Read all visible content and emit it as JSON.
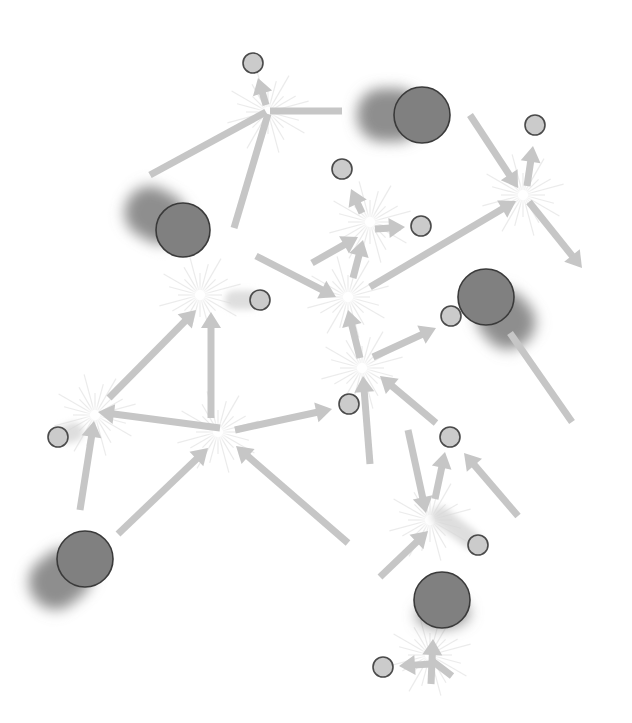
{
  "diagram": {
    "title": "",
    "type": "particle-interaction-network",
    "colors": {
      "background": "#ffffff",
      "arrow": "#c6c6c6",
      "large_particle_fill": "#808080",
      "small_particle_fill": "#cbcbcb",
      "particle_outline": "#3a3a3a",
      "burst": "#e6e6e6"
    },
    "large_particles": [
      {
        "id": "L1",
        "x": 183,
        "y": 230,
        "r": 27,
        "trail_dx": -55,
        "trail_dy": -30
      },
      {
        "id": "L2",
        "x": 422,
        "y": 115,
        "r": 28,
        "trail_dx": -65,
        "trail_dy": 0
      },
      {
        "id": "L3",
        "x": 486,
        "y": 297,
        "r": 28,
        "trail_dx": 40,
        "trail_dy": 45
      },
      {
        "id": "L4",
        "x": 85,
        "y": 559,
        "r": 28,
        "trail_dx": -50,
        "trail_dy": 40
      },
      {
        "id": "L5",
        "x": 442,
        "y": 600,
        "r": 28,
        "trail_dx": 2,
        "trail_dy": 28
      }
    ],
    "small_particles": [
      {
        "id": "S1",
        "x": 253,
        "y": 63,
        "r": 10
      },
      {
        "id": "S2",
        "x": 535,
        "y": 125,
        "r": 10
      },
      {
        "id": "S3",
        "x": 342,
        "y": 169,
        "r": 10
      },
      {
        "id": "S4",
        "x": 421,
        "y": 226,
        "r": 10
      },
      {
        "id": "S5",
        "x": 260,
        "y": 300,
        "r": 10,
        "trail_dx": -35,
        "trail_dy": 0
      },
      {
        "id": "S6",
        "x": 451,
        "y": 316,
        "r": 10
      },
      {
        "id": "S7",
        "x": 349,
        "y": 404,
        "r": 10
      },
      {
        "id": "S8",
        "x": 58,
        "y": 437,
        "r": 10,
        "trail_dx": 25,
        "trail_dy": -8
      },
      {
        "id": "S9",
        "x": 450,
        "y": 437,
        "r": 10
      },
      {
        "id": "S10",
        "x": 478,
        "y": 545,
        "r": 10,
        "trail_dx": -45,
        "trail_dy": -35
      },
      {
        "id": "S11",
        "x": 383,
        "y": 667,
        "r": 10
      }
    ],
    "vertices": [
      {
        "id": "V1",
        "x": 268,
        "y": 112
      },
      {
        "id": "V2",
        "x": 523,
        "y": 195
      },
      {
        "id": "V3",
        "x": 370,
        "y": 222
      },
      {
        "id": "V4",
        "x": 200,
        "y": 295
      },
      {
        "id": "V5",
        "x": 348,
        "y": 297
      },
      {
        "id": "V6",
        "x": 362,
        "y": 368
      },
      {
        "id": "V7",
        "x": 95,
        "y": 415
      },
      {
        "id": "V8",
        "x": 218,
        "y": 432
      },
      {
        "id": "V9",
        "x": 430,
        "y": 520
      },
      {
        "id": "V10",
        "x": 430,
        "y": 655
      }
    ],
    "arrows": [
      {
        "x1": 150,
        "y1": 175,
        "x2": 266,
        "y2": 112,
        "head": false
      },
      {
        "x1": 234,
        "y1": 228,
        "x2": 268,
        "y2": 114,
        "head": false
      },
      {
        "x1": 270,
        "y1": 111,
        "x2": 342,
        "y2": 111,
        "head": false
      },
      {
        "x1": 266,
        "y1": 105,
        "x2": 258,
        "y2": 78,
        "head": true
      },
      {
        "x1": 470,
        "y1": 115,
        "x2": 518,
        "y2": 188,
        "head": true
      },
      {
        "x1": 370,
        "y1": 287,
        "x2": 516,
        "y2": 201,
        "head": true
      },
      {
        "x1": 527,
        "y1": 186,
        "x2": 533,
        "y2": 146,
        "head": true
      },
      {
        "x1": 529,
        "y1": 202,
        "x2": 582,
        "y2": 268,
        "head": true
      },
      {
        "x1": 312,
        "y1": 263,
        "x2": 358,
        "y2": 237,
        "head": true
      },
      {
        "x1": 353,
        "y1": 278,
        "x2": 363,
        "y2": 240,
        "head": true
      },
      {
        "x1": 362,
        "y1": 213,
        "x2": 351,
        "y2": 189,
        "head": true
      },
      {
        "x1": 375,
        "y1": 229,
        "x2": 405,
        "y2": 227,
        "head": true
      },
      {
        "x1": 256,
        "y1": 256,
        "x2": 336,
        "y2": 297,
        "head": true
      },
      {
        "x1": 360,
        "y1": 358,
        "x2": 348,
        "y2": 310,
        "head": true
      },
      {
        "x1": 373,
        "y1": 357,
        "x2": 436,
        "y2": 328,
        "head": true
      },
      {
        "x1": 109,
        "y1": 398,
        "x2": 196,
        "y2": 310,
        "head": true
      },
      {
        "x1": 211,
        "y1": 418,
        "x2": 211,
        "y2": 312,
        "head": true
      },
      {
        "x1": 220,
        "y1": 428,
        "x2": 98,
        "y2": 412,
        "head": true
      },
      {
        "x1": 80,
        "y1": 510,
        "x2": 94,
        "y2": 421,
        "head": true
      },
      {
        "x1": 118,
        "y1": 534,
        "x2": 208,
        "y2": 448,
        "head": true
      },
      {
        "x1": 348,
        "y1": 543,
        "x2": 236,
        "y2": 446,
        "head": true
      },
      {
        "x1": 235,
        "y1": 430,
        "x2": 332,
        "y2": 409,
        "head": true
      },
      {
        "x1": 370,
        "y1": 464,
        "x2": 363,
        "y2": 376,
        "head": true
      },
      {
        "x1": 436,
        "y1": 423,
        "x2": 380,
        "y2": 376,
        "head": true
      },
      {
        "x1": 572,
        "y1": 422,
        "x2": 510,
        "y2": 333,
        "head": false
      },
      {
        "x1": 408,
        "y1": 430,
        "x2": 426,
        "y2": 513,
        "head": true
      },
      {
        "x1": 435,
        "y1": 499,
        "x2": 445,
        "y2": 452,
        "head": true
      },
      {
        "x1": 518,
        "y1": 516,
        "x2": 464,
        "y2": 453,
        "head": true
      },
      {
        "x1": 380,
        "y1": 577,
        "x2": 428,
        "y2": 531,
        "head": true
      },
      {
        "x1": 431,
        "y1": 684,
        "x2": 433,
        "y2": 639,
        "head": true
      },
      {
        "x1": 431,
        "y1": 664,
        "x2": 399,
        "y2": 666,
        "head": true
      },
      {
        "x1": 431,
        "y1": 660,
        "x2": 452,
        "y2": 676,
        "head": false
      }
    ]
  }
}
